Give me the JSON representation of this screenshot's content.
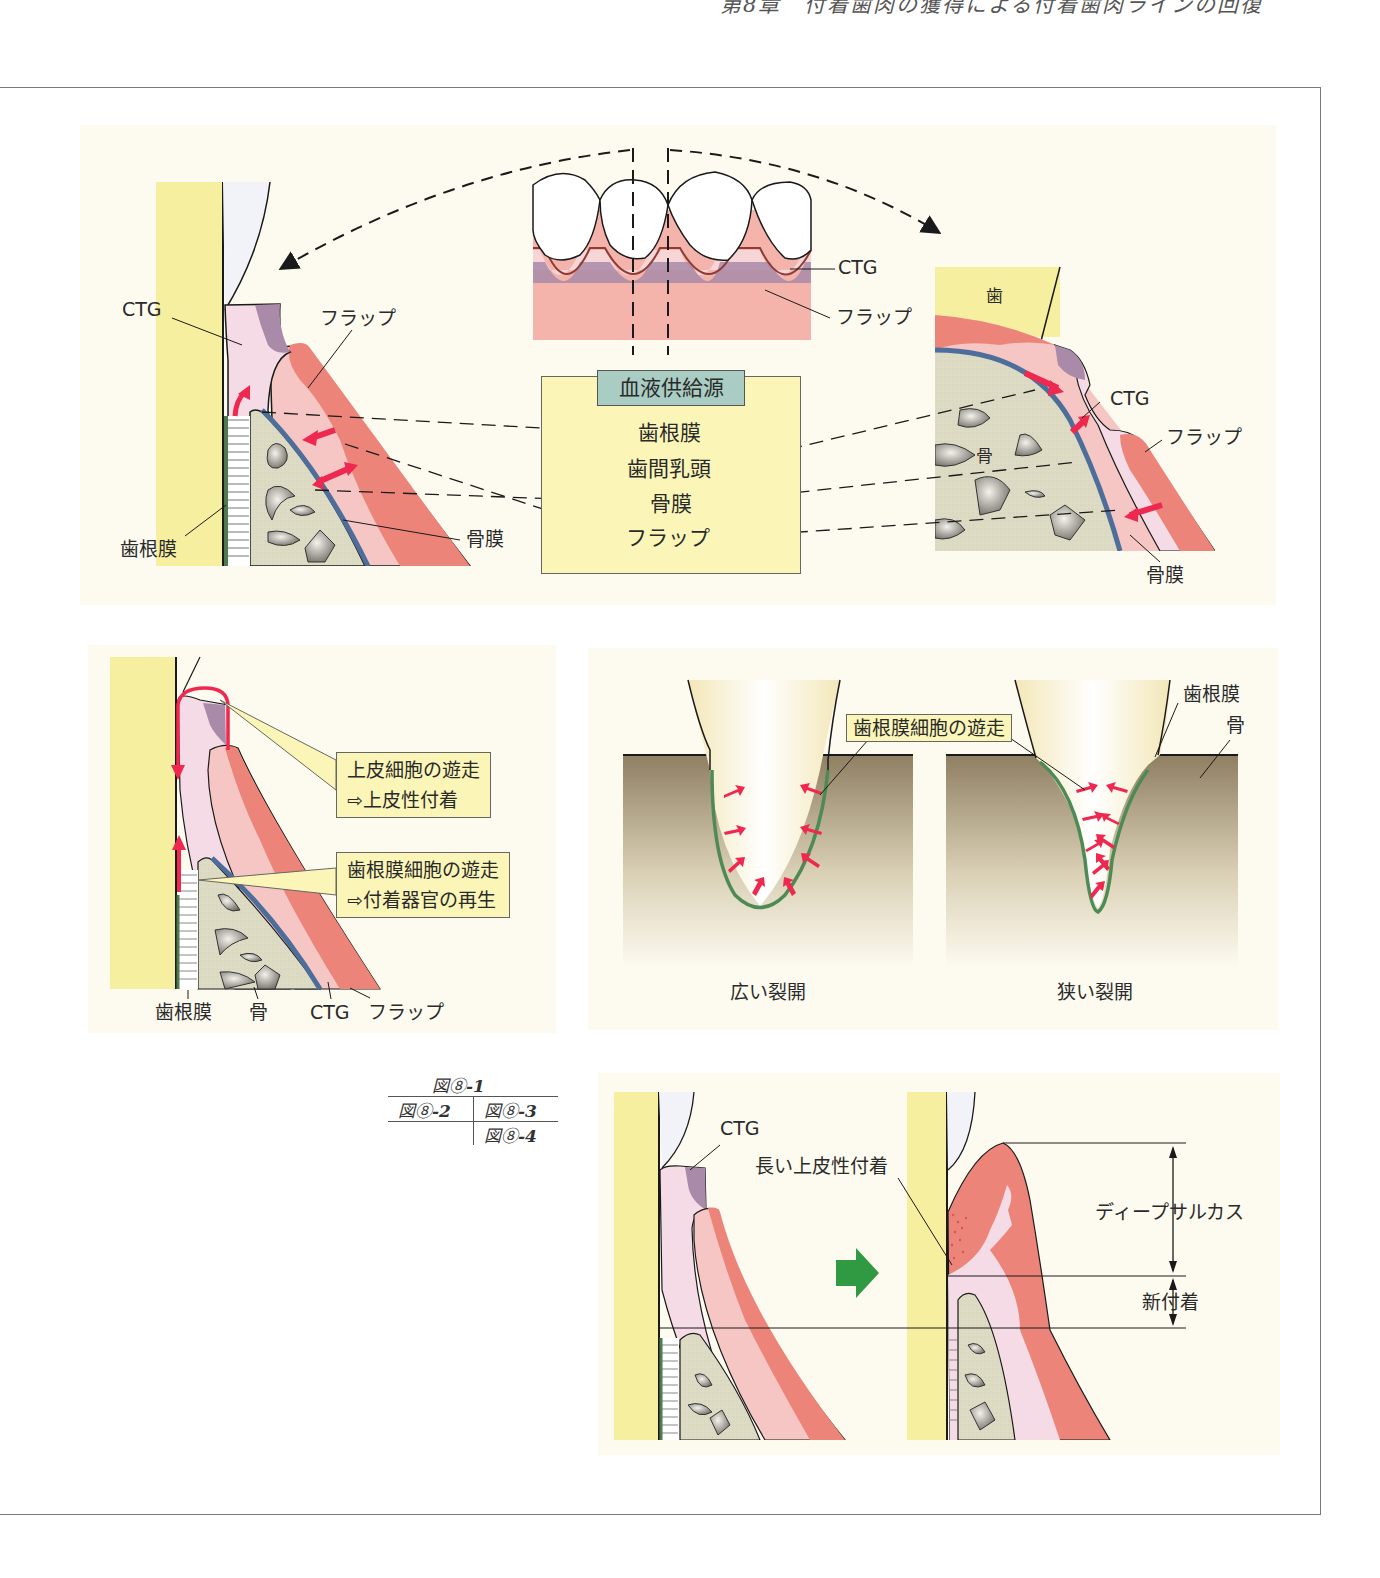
{
  "page": {
    "running_header": "第8章　付着歯肉の獲得による付着歯肉ラインの回復",
    "colors": {
      "panel_bg": "#fdfbef",
      "tooth": "#f6ef9f",
      "ctg": "#f4dbe6",
      "ctg_dark": "#a98aa8",
      "flap": "#f5c6c3",
      "flap_dark": "#ec8479",
      "bone": "#dedbc5",
      "periosteum": "#4d6d9a",
      "pdl": "#4d7a4e",
      "arrow_red": "#ef2850",
      "arrow_green": "#2f9a41",
      "box_yellow": "#fbf6b8",
      "box_teal": "#a9cdc3"
    }
  },
  "figure_1": {
    "left_labels": {
      "ctg": "CTG",
      "flap": "フラップ",
      "pdl": "歯根膜",
      "periosteum": "骨膜"
    },
    "center_labels": {
      "ctg": "CTG",
      "flap": "フラップ"
    },
    "blood_supply": {
      "title": "血液供給源",
      "items": [
        "歯根膜",
        "歯間乳頭",
        "骨膜",
        "フラップ"
      ]
    },
    "right_labels": {
      "tooth": "歯",
      "ctg": "CTG",
      "flap": "フラップ",
      "bone": "骨",
      "periosteum": "骨膜"
    }
  },
  "figure_2": {
    "callout_epithelial": {
      "line1": "上皮細胞の遊走",
      "line2": "⇨上皮性付着"
    },
    "callout_pdl": {
      "line1": "歯根膜細胞の遊走",
      "line2": "⇨付着器官の再生"
    },
    "bottom_labels": [
      "歯根膜",
      "骨",
      "CTG",
      "フラップ"
    ]
  },
  "figure_3": {
    "callout": "歯根膜細胞の遊走",
    "labels": {
      "pdl": "歯根膜",
      "bone": "骨"
    },
    "captions": {
      "wide": "広い裂開",
      "narrow": "狭い裂開"
    }
  },
  "figure_index": {
    "fig1": {
      "prefix": "図⑧",
      "suffix": "-1"
    },
    "fig2": {
      "prefix": "図⑧",
      "suffix": "-2"
    },
    "fig3": {
      "prefix": "図⑧",
      "suffix": "-3"
    },
    "fig4": {
      "prefix": "図⑧",
      "suffix": "-4"
    }
  },
  "figure_4": {
    "labels": {
      "ctg": "CTG",
      "long_epithelial": "長い上皮性付着",
      "deep_sulcus": "ディープサルカス",
      "new_attachment": "新付着"
    }
  }
}
